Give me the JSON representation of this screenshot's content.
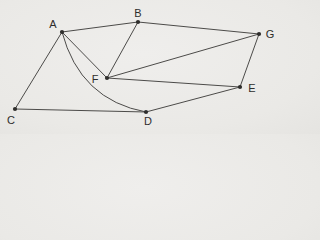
{
  "figure": {
    "background_color": "#eae9e6",
    "edge_color": "#4c4b49",
    "node_color": "#2f2e2c",
    "label_color": "#2e2d2b",
    "nodes": [
      {
        "id": "A",
        "label": "A",
        "x": 62,
        "y": 32,
        "label_x": 53,
        "label_y": 28
      },
      {
        "id": "B",
        "label": "B",
        "x": 138,
        "y": 22,
        "label_x": 138,
        "label_y": 17
      },
      {
        "id": "C",
        "label": "C",
        "x": 15,
        "y": 109,
        "label_x": 11,
        "label_y": 124
      },
      {
        "id": "D",
        "label": "D",
        "x": 146,
        "y": 112,
        "label_x": 148,
        "label_y": 125
      },
      {
        "id": "E",
        "label": "E",
        "x": 240,
        "y": 87,
        "label_x": 252,
        "label_y": 92
      },
      {
        "id": "F",
        "label": "F",
        "x": 107,
        "y": 78,
        "label_x": 95,
        "label_y": 83
      },
      {
        "id": "G",
        "label": "G",
        "x": 259,
        "y": 34,
        "label_x": 270,
        "label_y": 38
      }
    ],
    "edges": [
      {
        "from": "A",
        "to": "B"
      },
      {
        "from": "A",
        "to": "C"
      },
      {
        "from": "A",
        "to": "F"
      },
      {
        "from": "A",
        "to": "D",
        "curve_control": [
          80,
          100
        ]
      },
      {
        "from": "B",
        "to": "F"
      },
      {
        "from": "B",
        "to": "G"
      },
      {
        "from": "C",
        "to": "D"
      },
      {
        "from": "D",
        "to": "E"
      },
      {
        "from": "E",
        "to": "F"
      },
      {
        "from": "E",
        "to": "G"
      },
      {
        "from": "F",
        "to": "G"
      }
    ]
  }
}
